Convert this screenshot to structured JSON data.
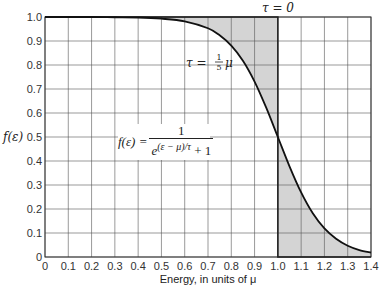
{
  "chart_data": {
    "type": "line",
    "title": "",
    "xlabel": "Energy, in units of μ",
    "ylabel": "f(ε)",
    "xlim": [
      0,
      1.4
    ],
    "ylim": [
      0,
      1.0
    ],
    "grid": true,
    "x_ticks": [
      "0",
      "0.1",
      "0.2",
      "0.3",
      "0.4",
      "0.5",
      "0.6",
      "0.7",
      "0.8",
      "0.9",
      "1.0",
      "1.1",
      "1.2",
      "1.3",
      "1.4"
    ],
    "y_ticks": [
      "0",
      "0.1",
      "0.2",
      "0.3",
      "0.4",
      "0.5",
      "0.6",
      "0.7",
      "0.8",
      "0.9",
      "1.0"
    ],
    "series": [
      {
        "name": "τ = 0",
        "style": "step",
        "x": [
          0,
          1.0,
          1.0,
          1.4
        ],
        "values": [
          1.0,
          1.0,
          0.0,
          0.0
        ]
      },
      {
        "name": "τ = 1/5 μ",
        "style": "curve",
        "x": [
          0,
          0.1,
          0.2,
          0.3,
          0.4,
          0.5,
          0.6,
          0.7,
          0.75,
          0.8,
          0.85,
          0.9,
          0.95,
          1.0,
          1.05,
          1.1,
          1.15,
          1.2,
          1.25,
          1.3,
          1.35,
          1.4
        ],
        "values": [
          1.0,
          1.0,
          1.0,
          0.999,
          0.998,
          0.993,
          0.982,
          0.953,
          0.924,
          0.881,
          0.818,
          0.731,
          0.622,
          0.5,
          0.378,
          0.269,
          0.182,
          0.119,
          0.076,
          0.047,
          0.029,
          0.018
        ]
      }
    ],
    "shaded_regions": "area between τ=0 step and τ=1/5μ curve",
    "annotations": {
      "tau_zero": "τ = 0",
      "tau_fifth_prefix": "τ =",
      "tau_fifth_num": "1",
      "tau_fifth_den": "5",
      "tau_fifth_suffix": "μ",
      "formula_lhs": "f(ε) =",
      "formula_num": "1",
      "formula_exp": "(ε − μ)/τ",
      "formula_base": "e",
      "formula_plus": "+ 1"
    },
    "colors": {
      "shade": "#d4d4d4",
      "curve": "#111111",
      "grid": "#555555"
    }
  }
}
